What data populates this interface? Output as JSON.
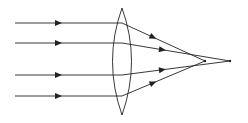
{
  "diagram": {
    "title": "",
    "stroke_color": "#222222",
    "background_color": "#ffffff",
    "lens": {
      "type": "biconvex"
    },
    "rays": [
      {
        "id": "outer-top",
        "converges_to": "near-focus"
      },
      {
        "id": "inner-top",
        "converges_to": "far-focus"
      },
      {
        "id": "inner-bottom",
        "converges_to": "far-focus"
      },
      {
        "id": "outer-bottom",
        "converges_to": "near-focus"
      }
    ],
    "focal_points": [
      {
        "id": "near-focus"
      },
      {
        "id": "far-focus"
      }
    ]
  }
}
